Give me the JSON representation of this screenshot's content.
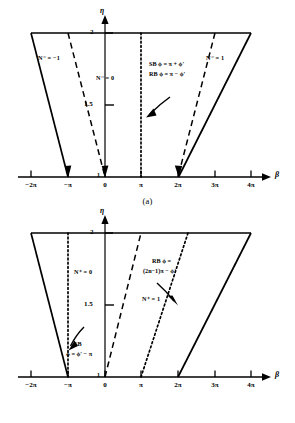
{
  "figure": {
    "type": "line-diagram",
    "background": "#ffffff",
    "line_color": "#000000",
    "panels": [
      {
        "id": "a",
        "caption": "(a)",
        "yaxis": {
          "label": "η",
          "ticks": [
            {
              "value": 2,
              "label": "2"
            },
            {
              "value": 1.5,
              "label": "1.5"
            },
            {
              "value": 1,
              "label": "1"
            }
          ],
          "range": [
            1,
            2
          ]
        },
        "xaxis": {
          "label": "β",
          "ticks": [
            {
              "value": -2,
              "label": "−2π"
            },
            {
              "value": -1,
              "label": "−π"
            },
            {
              "value": 0,
              "label": "0"
            },
            {
              "value": 1,
              "label": "π"
            },
            {
              "value": 2,
              "label": "2π"
            },
            {
              "value": 3,
              "label": "3π"
            },
            {
              "value": 4,
              "label": "4π"
            }
          ],
          "range": [
            -2.35,
            4.45
          ]
        },
        "region_labels": [
          {
            "text": "N⁻ = −1",
            "x": -1.85,
            "y": 1.78
          },
          {
            "text": "N⁻ = 0",
            "x": -0.32,
            "y": 1.66
          },
          {
            "text": "N⁻ = 1",
            "x": 3.05,
            "y": 1.78
          }
        ],
        "annotation": {
          "lines": [
            "SB  ϕ = π + ϕ'",
            "RB  ϕ = π − ϕ'"
          ],
          "x": 1.25,
          "y": 1.82
        },
        "curves": [
          {
            "name": "solid-left",
            "style": "solid",
            "from": [
              -2,
              2
            ],
            "to": [
              -1,
              1
            ]
          },
          {
            "name": "dashed-left",
            "style": "dashed",
            "from": [
              -1,
              2
            ],
            "to": [
              0,
              1
            ]
          },
          {
            "name": "dotted-center",
            "style": "dotted",
            "from": [
              1,
              1
            ],
            "to": [
              1,
              2
            ]
          },
          {
            "name": "dashed-right",
            "style": "dashed",
            "from": [
              3,
              2
            ],
            "to": [
              2,
              1
            ]
          },
          {
            "name": "solid-right",
            "style": "solid",
            "from": [
              4,
              2
            ],
            "to": [
              2,
              1
            ]
          },
          {
            "name": "top-edge",
            "style": "solid",
            "from": [
              -2,
              2
            ],
            "to": [
              4,
              2
            ]
          }
        ],
        "arrows": [
          {
            "name": "annotation-arrow",
            "from": [
              1.22,
              1.72
            ],
            "to": [
              0.82,
              1.47
            ]
          }
        ]
      },
      {
        "id": "b",
        "caption": "(b)",
        "yaxis": {
          "label": "η",
          "ticks": [
            {
              "value": 2,
              "label": "2"
            },
            {
              "value": 1.5,
              "label": "1.5"
            },
            {
              "value": 1,
              "label": "1"
            }
          ],
          "range": [
            1,
            2
          ]
        },
        "xaxis": {
          "label": "β",
          "ticks": [
            {
              "value": -2,
              "label": "−2π"
            },
            {
              "value": -1,
              "label": "−π"
            },
            {
              "value": 0,
              "label": "0"
            },
            {
              "value": 1,
              "label": "π"
            },
            {
              "value": 2,
              "label": "2π"
            },
            {
              "value": 3,
              "label": "3π"
            },
            {
              "value": 4,
              "label": "4π"
            }
          ],
          "range": [
            -2.35,
            4.45
          ]
        },
        "region_labels": [
          {
            "text": "N⁺ = 0",
            "x": -0.95,
            "y": 1.66
          },
          {
            "text": "N⁺ = 1",
            "x": 1.15,
            "y": 1.52
          }
        ],
        "annotations": [
          {
            "name": "sb-annotation",
            "lines": [
              "SB",
              "ϕ = ϕ' − π"
            ],
            "x": -1.1,
            "y": 1.27
          },
          {
            "name": "rb-annotation",
            "lines": [
              "RB ϕ =",
              "(2n−1)π − ϕ'"
            ],
            "x": 1.45,
            "y": 1.84
          }
        ],
        "curves": [
          {
            "name": "solid-left",
            "style": "solid",
            "from": [
              -2,
              2
            ],
            "to": [
              -1,
              1
            ]
          },
          {
            "name": "dotted-left",
            "style": "dotted",
            "from": [
              -1,
              1
            ],
            "to": [
              -1,
              2
            ]
          },
          {
            "name": "dashed-center",
            "style": "dashed",
            "from": [
              0,
              1
            ],
            "to": [
              1,
              2
            ]
          },
          {
            "name": "dotted-right",
            "style": "dotted",
            "from": [
              1,
              1
            ],
            "to": [
              2.3,
              2
            ]
          },
          {
            "name": "solid-right",
            "style": "solid",
            "from": [
              2,
              1
            ],
            "to": [
              4,
              2
            ]
          },
          {
            "name": "top-edge",
            "style": "solid",
            "from": [
              -2,
              2
            ],
            "to": [
              4,
              2
            ]
          }
        ],
        "arrows": [
          {
            "name": "sb-arrow",
            "from": [
              -0.78,
              1.38
            ],
            "to": [
              -1.02,
              1.2
            ]
          },
          {
            "name": "rb-arrow",
            "from": [
              1.62,
              1.74
            ],
            "to": [
              2.02,
              1.58
            ]
          }
        ]
      }
    ]
  }
}
